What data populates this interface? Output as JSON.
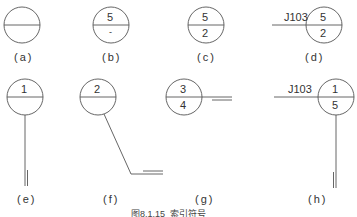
{
  "caption": "图8.1.15  索引符号",
  "symbols": [
    {
      "id": "a",
      "label": "(a)",
      "top": "",
      "bottom": ""
    },
    {
      "id": "b",
      "label": "(b)",
      "top": "5",
      "bottom": "-"
    },
    {
      "id": "c",
      "label": "(c)",
      "top": "5",
      "bottom": "2"
    },
    {
      "id": "d",
      "label": "(d)",
      "top": "5",
      "bottom": "2",
      "code": "J103"
    },
    {
      "id": "e",
      "label": "(e)",
      "top": "1",
      "bottom": ""
    },
    {
      "id": "f",
      "label": "(f)",
      "top": "2",
      "bottom": ""
    },
    {
      "id": "g",
      "label": "(g)",
      "top": "3",
      "bottom": "4"
    },
    {
      "id": "h",
      "label": "(h)",
      "top": "1",
      "bottom": "5",
      "code": "J103"
    }
  ],
  "colors": {
    "line": "#555555",
    "text": "#333333"
  }
}
